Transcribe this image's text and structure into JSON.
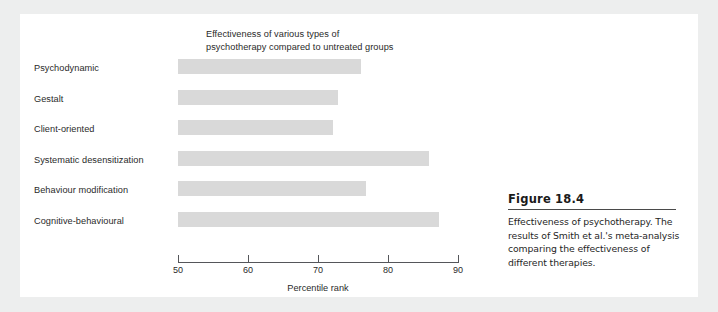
{
  "figure": {
    "title": "Effectiveness of various types of psychotherapy compared to untreated groups",
    "title_line1": "Effectiveness of various types of",
    "title_line2": "psychotherapy compared to untreated groups",
    "caption_title": "Figure 18.4",
    "caption_text": "Effectiveness of psychotherapy. The results of Smith et al.'s meta-analysis comparing the effectiveness of different therapies.",
    "bar_color": "#d9d9d9",
    "axis_color": "#55565a",
    "panel_color": "#ffffff",
    "background_color": "#edeeee"
  },
  "chart_data": {
    "type": "bar",
    "orientation": "horizontal",
    "title": "Effectiveness of various types of psychotherapy compared to untreated groups",
    "xlabel": "Percentile rank",
    "ylabel": "",
    "xlim": [
      50,
      90
    ],
    "xticks": [
      50,
      60,
      70,
      80,
      90
    ],
    "xtick_labels": [
      "50",
      "60",
      "70",
      "80",
      "90"
    ],
    "grid": false,
    "legend": false,
    "categories": [
      "Psychodynamic",
      "Gestalt",
      "Client-oriented",
      "Systematic desensitization",
      "Behaviour modification",
      "Cognitive-behavioural"
    ],
    "values": [
      76.1,
      72.9,
      72.2,
      85.8,
      76.9,
      87.3
    ]
  }
}
